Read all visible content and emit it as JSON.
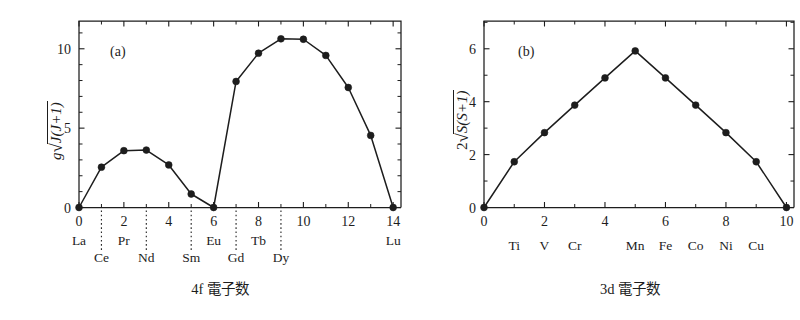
{
  "figure": {
    "background": "#ffffff",
    "ink_color": "#1d1d1d",
    "panel_tags": {
      "a": "(a)",
      "b": "(b)"
    }
  },
  "chart_data": [
    {
      "type": "line",
      "panel": "(a)",
      "title": "",
      "xlabel": "4f 電子数",
      "ylabel": "g√(J(J+1))",
      "ylabel_parts": {
        "prefix": "g",
        "radical": "√",
        "inner": "J(J+1)"
      },
      "xlim": [
        0,
        14.35
      ],
      "ylim": [
        0,
        11.75
      ],
      "xticks": [
        0,
        2,
        4,
        6,
        8,
        10,
        12,
        14
      ],
      "xticklabels": [
        "0",
        "2",
        "4",
        "6",
        "8",
        "10",
        "12",
        "14"
      ],
      "xminor": [
        1,
        3,
        5,
        7,
        9,
        11,
        13
      ],
      "yticks": [
        0,
        5,
        10
      ],
      "yticklabels": [
        "0",
        "5",
        "10"
      ],
      "yminor": [
        1,
        2,
        3,
        4,
        6,
        7,
        8,
        9,
        11
      ],
      "grid": false,
      "legend": "none",
      "x": [
        0,
        1,
        2,
        3,
        4,
        5,
        6,
        7,
        8,
        9,
        10,
        11,
        12,
        13,
        14
      ],
      "values": [
        0,
        2.54,
        3.58,
        3.62,
        2.68,
        0.85,
        0,
        7.94,
        9.72,
        10.63,
        10.6,
        9.58,
        7.56,
        4.54,
        0
      ],
      "element_labels_top": [
        {
          "x": 0,
          "text": "La"
        },
        {
          "x": 2,
          "text": "Pr"
        },
        {
          "x": 6,
          "text": "Eu"
        },
        {
          "x": 8,
          "text": "Tb"
        },
        {
          "x": 14,
          "text": "Lu"
        }
      ],
      "element_labels_bottom": [
        {
          "x": 1,
          "text": "Ce"
        },
        {
          "x": 3,
          "text": "Nd"
        },
        {
          "x": 5,
          "text": "Sm"
        },
        {
          "x": 7,
          "text": "Gd"
        },
        {
          "x": 9,
          "text": "Dy"
        }
      ],
      "guide_lines_x": [
        1,
        3,
        5,
        7,
        9
      ]
    },
    {
      "type": "line",
      "panel": "(b)",
      "title": "",
      "xlabel": "3d 電子数",
      "ylabel": "2√(S(S+1))",
      "ylabel_parts": {
        "prefix": "2",
        "radical": "√",
        "inner": "S(S+1)"
      },
      "xlim": [
        0,
        10.25
      ],
      "ylim": [
        0,
        7.05
      ],
      "xticks": [
        0,
        2,
        4,
        6,
        8,
        10
      ],
      "xticklabels": [
        "0",
        "2",
        "4",
        "6",
        "8",
        "10"
      ],
      "xminor": [
        1,
        3,
        5,
        7,
        9
      ],
      "yticks": [
        0,
        2,
        4,
        6
      ],
      "yticklabels": [
        "0",
        "2",
        "4",
        "6"
      ],
      "yminor": [
        1,
        3,
        5,
        7
      ],
      "grid": false,
      "legend": "none",
      "x": [
        0,
        1,
        2,
        3,
        4,
        5,
        6,
        7,
        8,
        9,
        10
      ],
      "values": [
        0,
        1.73,
        2.83,
        3.87,
        4.9,
        5.92,
        4.9,
        3.87,
        2.83,
        1.73,
        0
      ],
      "element_labels_top": [
        {
          "x": 1,
          "text": "Ti"
        },
        {
          "x": 2,
          "text": "V"
        },
        {
          "x": 3,
          "text": "Cr"
        },
        {
          "x": 5,
          "text": "Mn"
        },
        {
          "x": 6,
          "text": "Fe"
        },
        {
          "x": 7,
          "text": "Co"
        },
        {
          "x": 8,
          "text": "Ni"
        },
        {
          "x": 9,
          "text": "Cu"
        }
      ],
      "element_labels_bottom": [],
      "guide_lines_x": []
    }
  ]
}
